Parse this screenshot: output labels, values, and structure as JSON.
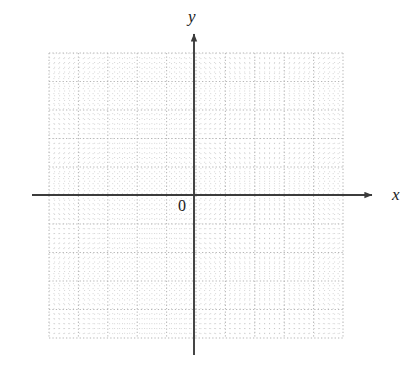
{
  "figure": {
    "kind": "cartesian-coordinate-grid",
    "background_color": "#ffffff",
    "width": 412,
    "height": 376
  },
  "labels": {
    "y_axis": "y",
    "x_axis": "x",
    "origin": "0"
  },
  "chart_data": {
    "type": "scatter",
    "title": "",
    "subtitle": "",
    "xlabel": "x",
    "ylabel": "y",
    "origin_label": "0",
    "series": [],
    "x": [],
    "values": [],
    "categories": [],
    "annotations": [],
    "legend": [],
    "legend_position": "none",
    "grid": true,
    "grid_style": "dotted",
    "grid_color": "#b4b4b4",
    "axis_color": "#3c3c3c",
    "tick_labels_x": [],
    "tick_labels_y": [],
    "xlim": [
      -5,
      5
    ],
    "ylim": [
      -5,
      5
    ],
    "major_cells_x": 10,
    "major_cells_y": 10,
    "minor_per_major": 6,
    "note": "Empty graph paper: dotted square grid with solid x and y axes, arrowheads at the positive ends, no plotted data."
  },
  "geometry": {
    "grid": {
      "left": 49,
      "top": 53,
      "right": 343,
      "bottom": 338,
      "major_step_x": 29.4,
      "major_step_y": 28.5,
      "minor_step": 4.9
    },
    "axes": {
      "origin_x": 194,
      "origin_y": 195,
      "y_top": 28,
      "y_bottom": 355,
      "x_left": 32,
      "x_right": 378,
      "stroke_width": 1.9,
      "arrow_size": 7
    }
  }
}
